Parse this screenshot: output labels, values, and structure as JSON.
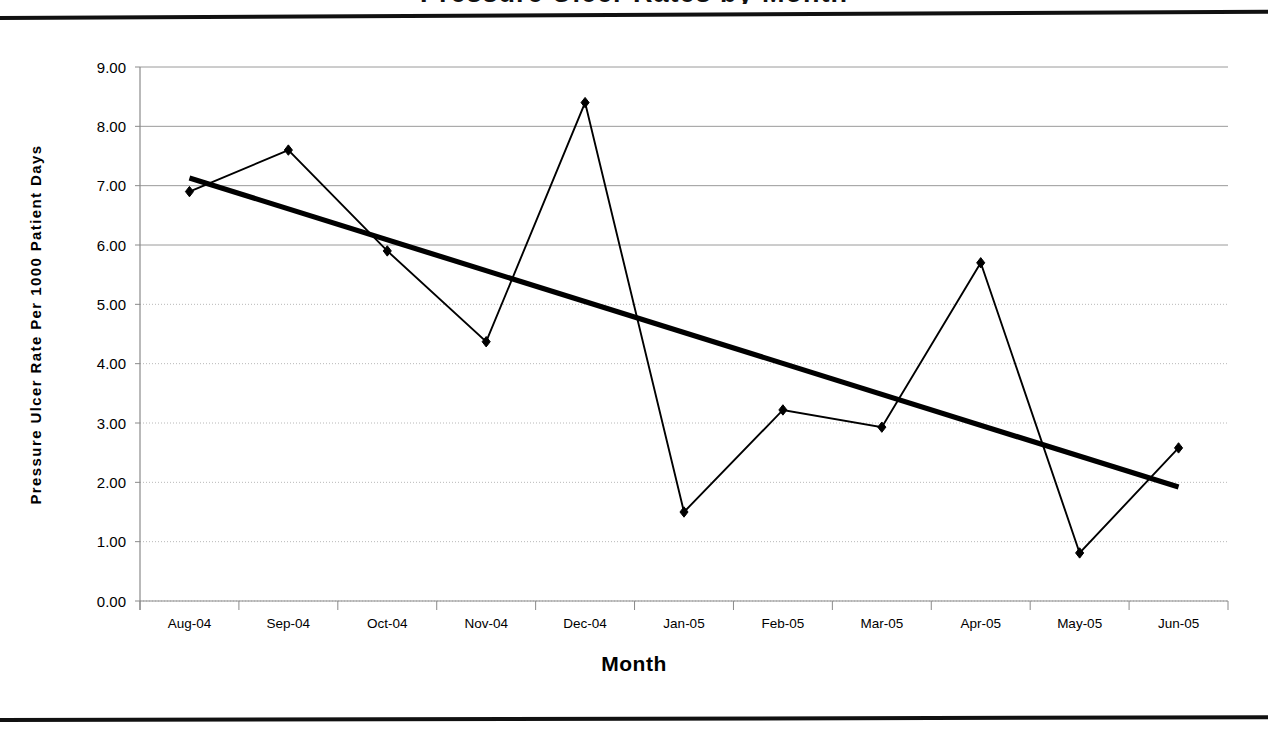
{
  "page": {
    "clipped_title": "Pressure Ulcer Rates by Month"
  },
  "chart_data": {
    "type": "line",
    "title": "",
    "xlabel": "Month",
    "ylabel": "Pressure Ulcer Rate Per 1000 Patient Days",
    "categories": [
      "Aug-04",
      "Sep-04",
      "Oct-04",
      "Nov-04",
      "Dec-04",
      "Jan-05",
      "Feb-05",
      "Mar-05",
      "Apr-05",
      "May-05",
      "Jun-05"
    ],
    "series": [
      {
        "name": "Pressure Ulcer Rate",
        "marker": "diamond",
        "values": [
          6.9,
          7.6,
          5.9,
          4.37,
          8.4,
          1.5,
          3.22,
          2.93,
          5.7,
          0.81,
          2.58
        ]
      },
      {
        "name": "Linear Trendline",
        "marker": "none",
        "values": [
          7.13,
          6.61,
          6.09,
          5.57,
          5.05,
          4.53,
          4.01,
          3.49,
          2.97,
          2.45,
          1.92
        ]
      }
    ],
    "ylim": [
      0.0,
      9.0
    ],
    "ytick_step": 1.0,
    "ytick_labels": [
      "9.00",
      "8.00",
      "7.00",
      "6.00",
      "5.00",
      "4.00",
      "3.00",
      "2.00",
      "1.00",
      "0.00"
    ],
    "grid": true,
    "legend": "none",
    "trendline_color": "#000000",
    "series_color": "#000000",
    "gridline_color": "#9a9a9a"
  }
}
